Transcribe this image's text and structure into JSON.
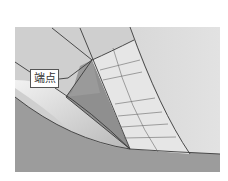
{
  "figure": {
    "label": "端点",
    "colors": {
      "background": "#ffffff",
      "upper_surface": "#d2d2d2",
      "right_surface": "#dcdcdc",
      "grid_patch": "#e4e4e4",
      "triangle_face": "#8e8e8e",
      "lower_floor": "#9a9a9a",
      "fillet_light": "#ececec",
      "edge_lines": "#3a3a3a"
    }
  }
}
